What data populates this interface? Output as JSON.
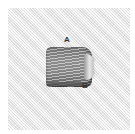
{
  "illustration": {
    "subject": "embroidery stitch sample on woven fabric",
    "labels": {
      "a": "A",
      "b": "B"
    },
    "colors": {
      "fabric": "#ebebeb",
      "thread": "#8c8c8c",
      "label_text": "#333333",
      "background": "#ffffff"
    }
  }
}
